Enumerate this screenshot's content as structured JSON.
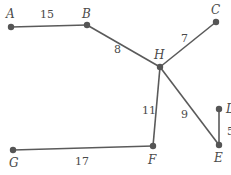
{
  "graph": {
    "nodes": [
      {
        "id": "A",
        "label": "A"
      },
      {
        "id": "B",
        "label": "B"
      },
      {
        "id": "C",
        "label": "C"
      },
      {
        "id": "H",
        "label": "H"
      },
      {
        "id": "D",
        "label": "D"
      },
      {
        "id": "E",
        "label": "E"
      },
      {
        "id": "F",
        "label": "F"
      },
      {
        "id": "G",
        "label": "G"
      }
    ],
    "edges": [
      {
        "from": "A",
        "to": "B",
        "weight": "15"
      },
      {
        "from": "B",
        "to": "H",
        "weight": "8"
      },
      {
        "from": "H",
        "to": "C",
        "weight": "7"
      },
      {
        "from": "H",
        "to": "F",
        "weight": "11"
      },
      {
        "from": "H",
        "to": "E",
        "weight": "9"
      },
      {
        "from": "D",
        "to": "E",
        "weight": "5"
      },
      {
        "from": "G",
        "to": "F",
        "weight": "17"
      }
    ]
  }
}
